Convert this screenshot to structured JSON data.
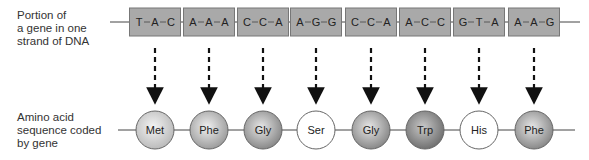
{
  "labels": {
    "dna": [
      "Portion of",
      "a gene in one",
      "strand of DNA"
    ],
    "amino": [
      "Amino acid",
      "sequence coded",
      "by gene"
    ]
  },
  "dna_codons": [
    [
      "T",
      "A",
      "C"
    ],
    [
      "A",
      "A",
      "A"
    ],
    [
      "C",
      "C",
      "A"
    ],
    [
      "A",
      "G",
      "G"
    ],
    [
      "C",
      "C",
      "A"
    ],
    [
      "A",
      "C",
      "C"
    ],
    [
      "G",
      "T",
      "A"
    ],
    [
      "A",
      "A",
      "G"
    ]
  ],
  "amino_acids": [
    {
      "name": "Met",
      "shade": "light"
    },
    {
      "name": "Phe",
      "shade": "medium"
    },
    {
      "name": "Gly",
      "shade": "dark"
    },
    {
      "name": "Ser",
      "shade": "white"
    },
    {
      "name": "Gly",
      "shade": "dark"
    },
    {
      "name": "Trp",
      "shade": "darker"
    },
    {
      "name": "His",
      "shade": "white"
    },
    {
      "name": "Phe",
      "shade": "dark"
    }
  ],
  "colors": {
    "box_fill": "#a9a9a9",
    "box_stroke": "#777777",
    "line": "#444444",
    "arrow": "#111111"
  }
}
